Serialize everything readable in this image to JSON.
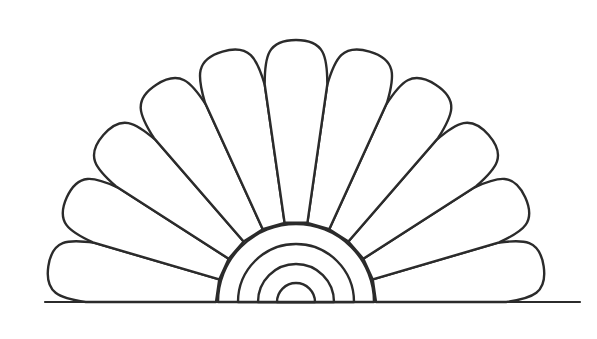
{
  "figure": {
    "background": "#ffffff",
    "stroke_color": "#2b2b2b",
    "center": [
      296,
      302
    ],
    "baseline": {
      "y": 302,
      "x_start": 45,
      "x_end": 580
    },
    "petal_count": 11,
    "arc_radii": [
      78,
      58,
      38,
      19
    ]
  }
}
